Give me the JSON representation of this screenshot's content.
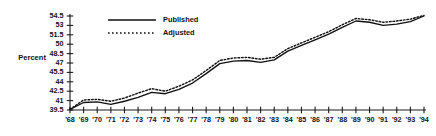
{
  "chart_data": {
    "type": "line",
    "title": "",
    "xlabel": "",
    "ylabel": "Percent",
    "grid": false,
    "legend_position": "top-center",
    "ylim": [
      39.5,
      54.5
    ],
    "ytick_values": [
      39.5,
      41,
      42.5,
      44,
      45.5,
      47,
      48.5,
      50,
      51.5,
      53,
      54.5
    ],
    "ytick_labels": [
      "39.5",
      "41",
      "42.5",
      "44",
      "45.5",
      "47",
      "48.5",
      "50",
      "51.5",
      "53",
      "54.5"
    ],
    "categories": [
      "'68",
      "'69",
      "'70",
      "'71",
      "'72",
      "'73",
      "'74",
      "'75",
      "'76",
      "'77",
      "'78",
      "'79",
      "'80",
      "'81",
      "'82",
      "'83",
      "'84",
      "'85",
      "'86",
      "'87",
      "'88",
      "'89",
      "'90",
      "'91",
      "'92",
      "'93",
      "'94"
    ],
    "x": [
      1968,
      1969,
      1970,
      1971,
      1972,
      1973,
      1974,
      1975,
      1976,
      1977,
      1978,
      1979,
      1980,
      1981,
      1982,
      1983,
      1984,
      1985,
      1986,
      1987,
      1988,
      1989,
      1990,
      1991,
      1992,
      1993,
      1994
    ],
    "series": [
      {
        "name": "Published",
        "style": "solid",
        "color": "#111111",
        "values": [
          39.6,
          40.7,
          40.8,
          40.4,
          40.9,
          41.5,
          42.3,
          42.1,
          42.8,
          43.8,
          45.3,
          46.9,
          47.3,
          47.4,
          47.1,
          47.5,
          48.9,
          49.8,
          50.7,
          51.6,
          52.7,
          53.7,
          53.5,
          53.0,
          53.2,
          53.6,
          54.5
        ]
      },
      {
        "name": "Adjusted",
        "style": "dotted",
        "color": "#111111",
        "values": [
          39.6,
          41.1,
          41.2,
          40.9,
          41.4,
          42.2,
          42.9,
          42.5,
          43.3,
          44.3,
          45.8,
          47.4,
          47.8,
          47.9,
          47.6,
          47.9,
          49.3,
          50.2,
          51.1,
          52.0,
          53.1,
          54.1,
          53.9,
          53.5,
          53.7,
          54.0,
          54.6
        ]
      }
    ]
  },
  "legend": {
    "entries": [
      {
        "label": "Published",
        "style": "solid"
      },
      {
        "label": "Adjusted",
        "style": "dotted"
      }
    ]
  }
}
